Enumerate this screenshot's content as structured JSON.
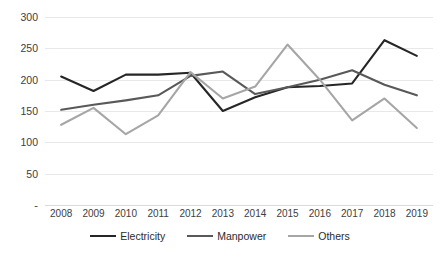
{
  "chart_data": {
    "type": "line",
    "title": "",
    "xlabel": "",
    "ylabel": "",
    "categories": [
      "2008",
      "2009",
      "2010",
      "2011",
      "2012",
      "2013",
      "2014",
      "2015",
      "2016",
      "2017",
      "2018",
      "2019"
    ],
    "ylim": [
      0,
      300
    ],
    "yticks": [
      "300",
      "250",
      "200",
      "150",
      "100",
      "50",
      "-"
    ],
    "ytick_values": [
      300,
      250,
      200,
      150,
      100,
      50,
      0
    ],
    "grid": true,
    "legend_position": "bottom",
    "series": [
      {
        "name": "Electricity",
        "color": "#262626",
        "values": [
          205,
          182,
          208,
          208,
          211,
          150,
          172,
          188,
          190,
          194,
          263,
          238
        ]
      },
      {
        "name": "Manpower",
        "color": "#595959",
        "values": [
          152,
          160,
          167,
          175,
          206,
          213,
          177,
          188,
          200,
          215,
          192,
          175
        ]
      },
      {
        "name": "Others",
        "color": "#a6a6a6",
        "values": [
          128,
          155,
          113,
          143,
          212,
          170,
          189,
          256,
          200,
          135,
          170,
          123
        ]
      }
    ]
  },
  "legend": {
    "items": [
      {
        "label": "Electricity"
      },
      {
        "label": "Manpower"
      },
      {
        "label": "Others"
      }
    ]
  },
  "colors": {
    "background": "#ffffff",
    "gridline": "#e8e8e8",
    "axis_text": "#404040",
    "electricity": "#262626",
    "manpower": "#595959",
    "others": "#a6a6a6"
  }
}
